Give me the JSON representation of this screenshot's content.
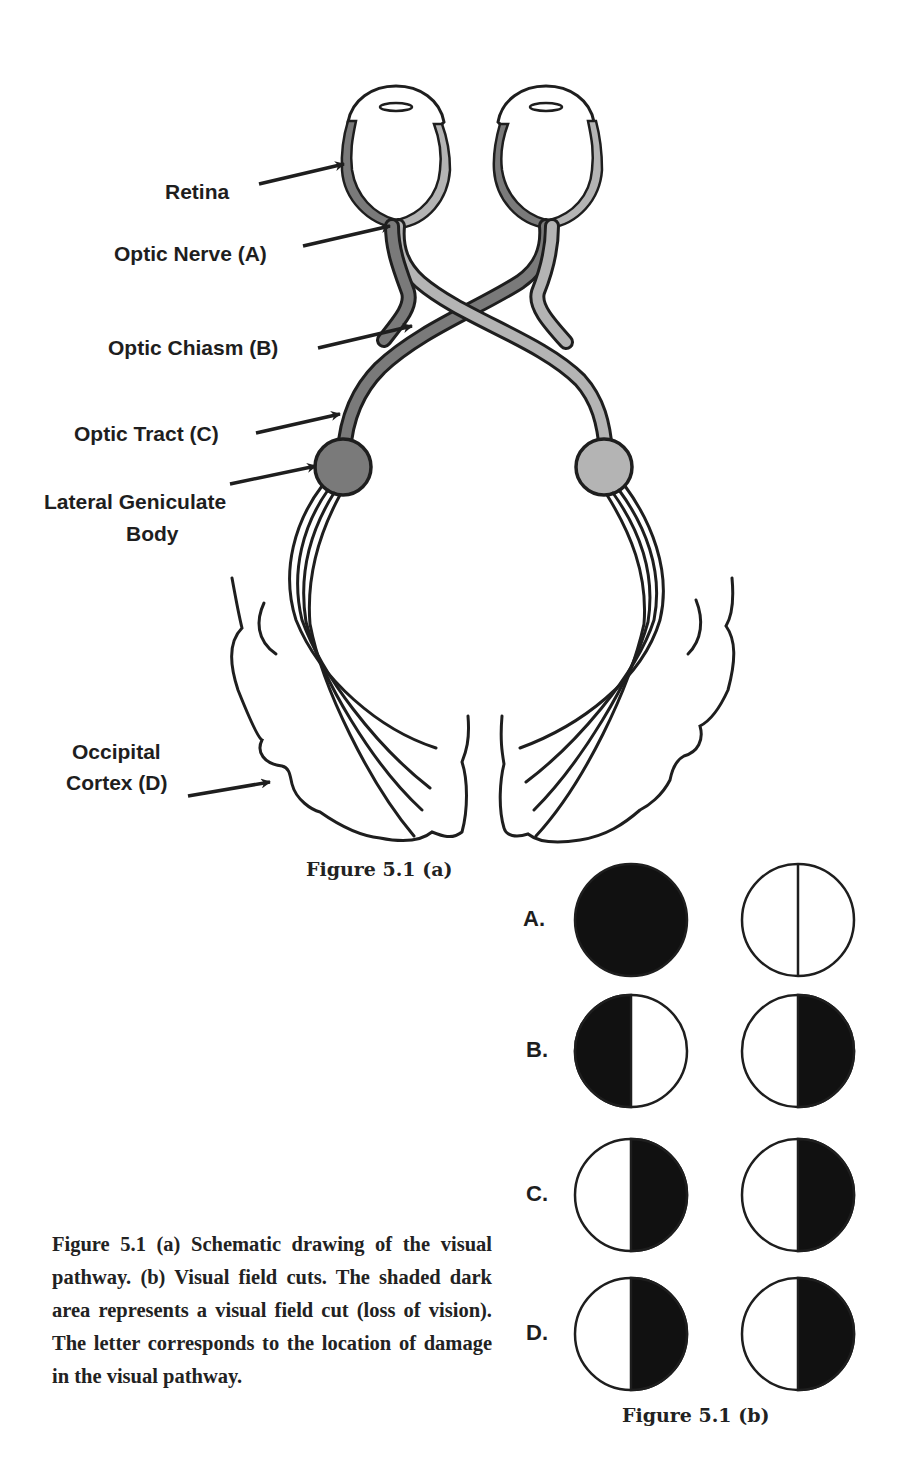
{
  "figure_a": {
    "caption": "Figure 5.1 (a)",
    "labels": {
      "retina": "Retina",
      "optic_nerve": "Optic Nerve (A)",
      "optic_chiasm": "Optic Chiasm (B)",
      "optic_tract": "Optic Tract (C)",
      "lgb_line1": "Lateral Geniculate",
      "lgb_line2": "Body",
      "occipital_line1": "Occipital",
      "occipital_line2": "Cortex (D)"
    },
    "colors": {
      "left_pathway": "#7a7a7a",
      "right_pathway": "#b4b4b4",
      "outline": "#1e1e1e"
    }
  },
  "figure_b": {
    "caption": "Figure 5.1 (b)",
    "rows": [
      {
        "letter": "A.",
        "left": "full",
        "right": "none"
      },
      {
        "letter": "B.",
        "left": "left-half",
        "right": "right-half"
      },
      {
        "letter": "C.",
        "left": "right-half",
        "right": "right-half"
      },
      {
        "letter": "D.",
        "left": "right-half",
        "right": "right-half"
      }
    ]
  },
  "body_caption": "Figure 5.1 (a) Schematic drawing of the visual pathway. (b) Visual field cuts. The shaded dark area repre­sents a visual field cut (loss of vision). The letter corresponds to the location of damage in the visual pathway."
}
